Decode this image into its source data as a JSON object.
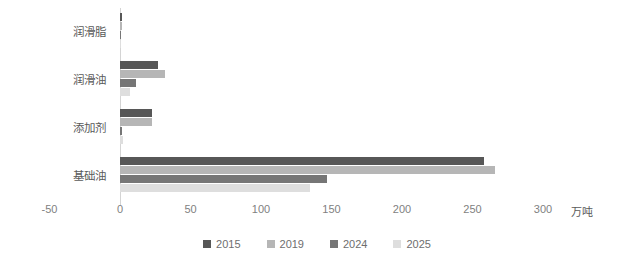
{
  "chart_data": {
    "type": "bar",
    "orientation": "horizontal",
    "title": "",
    "subtitle": "",
    "xlabel": "万吨",
    "ylabel": "",
    "xlim": [
      -50,
      300
    ],
    "xticks": [
      -50,
      0,
      50,
      100,
      150,
      200,
      250,
      300
    ],
    "xtick_labels": [
      "-50",
      "0",
      "50",
      "100",
      "150",
      "200",
      "250",
      "300"
    ],
    "grid": false,
    "legend_position": "bottom",
    "categories": [
      "润滑脂",
      "润滑油",
      "添加剂",
      "基础油"
    ],
    "series": [
      {
        "name": "2015",
        "color": "#575757",
        "values": [
          1.5,
          27,
          23,
          258
        ]
      },
      {
        "name": "2019",
        "color": "#b6b6b6",
        "values": [
          1.5,
          32,
          23,
          266
        ]
      },
      {
        "name": "2024",
        "color": "#767676",
        "values": [
          1.0,
          11,
          1.5,
          147
        ]
      },
      {
        "name": "2025",
        "color": "#dedede",
        "values": [
          0.8,
          7,
          2.0,
          135
        ]
      }
    ]
  },
  "axis": {
    "unit_label": "万吨"
  }
}
